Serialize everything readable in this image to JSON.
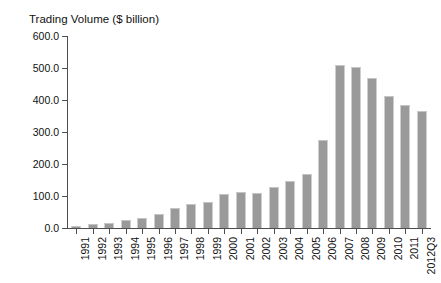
{
  "chart_data": {
    "type": "bar",
    "title": "Trading Volume ($ billion)",
    "xlabel": "",
    "ylabel": "Trading Volume ($ billion)",
    "ylim": [
      0,
      600
    ],
    "yticks": [
      0,
      100,
      200,
      300,
      400,
      500,
      600
    ],
    "ytick_labels": [
      "0.0",
      "100.0",
      "200.0",
      "300.0",
      "400.0",
      "500.0",
      "600.0"
    ],
    "grid": false,
    "legend": "none",
    "bar_color": "#9a9a9a",
    "categories": [
      "1991",
      "1992",
      "1993",
      "1994",
      "1995",
      "1996",
      "1997",
      "1998",
      "1999",
      "2000",
      "2001",
      "2002",
      "2003",
      "2004",
      "2005",
      "2006",
      "2007",
      "2008",
      "2009",
      "2010",
      "2011",
      "2012Q3"
    ],
    "values": [
      5,
      12,
      15,
      25,
      30,
      45,
      62,
      75,
      80,
      105,
      112,
      110,
      128,
      148,
      170,
      275,
      510,
      503,
      470,
      412,
      385,
      365
    ]
  }
}
